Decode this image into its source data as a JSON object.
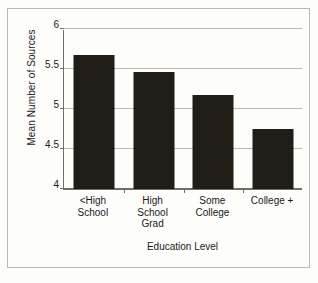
{
  "chart_data": {
    "type": "bar",
    "title": "",
    "xlabel": "Education Level",
    "ylabel": "Mean Number of Sources",
    "categories": [
      "<High School",
      "High School Grad",
      "Some College",
      "College +"
    ],
    "category_lines": [
      [
        "<High",
        "School"
      ],
      [
        "High",
        "School",
        "Grad"
      ],
      [
        "Some",
        "College"
      ],
      [
        "College +"
      ]
    ],
    "values": [
      5.67,
      5.46,
      5.17,
      4.75
    ],
    "ylim": [
      4,
      6
    ],
    "yticks": [
      4,
      4.5,
      5,
      5.5,
      6
    ],
    "ytick_labels": [
      "4",
      "4.5",
      "5",
      "5.5",
      "6"
    ],
    "grid": true,
    "legend": "none",
    "bar_color": "#211d17",
    "grid_color": "#b9b9b0",
    "axis_color": "#6f6f66",
    "background_color": "#fdfdfa"
  }
}
